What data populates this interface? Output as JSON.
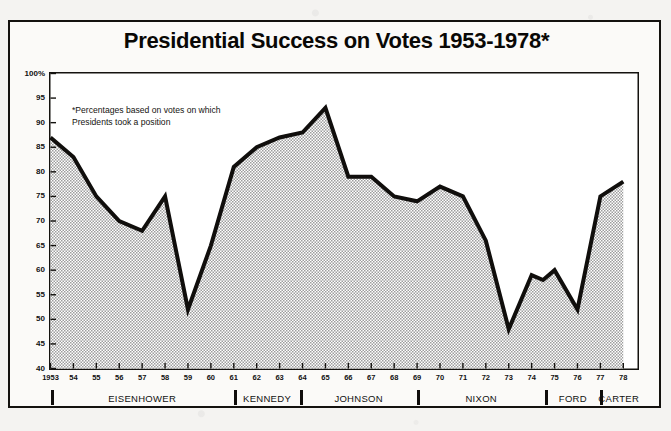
{
  "card": {
    "title": "Presidential Success on Votes 1953-1978*",
    "note": "*Percentages based on votes on which\nPresidents took a position"
  },
  "chart_data": {
    "type": "area",
    "title": "Presidential Success on Votes 1953-1978*",
    "subtitle": "*Percentages based on votes on which Presidents took a position",
    "xlabel": "",
    "ylabel": "",
    "ylim": [
      40,
      100
    ],
    "ytick_step": 5,
    "grid": false,
    "legend": "none",
    "fill": "#b9b9b9",
    "line_color": "#111111",
    "yticks": [
      "40",
      "45",
      "50",
      "55",
      "60",
      "65",
      "70",
      "75",
      "80",
      "85",
      "90",
      "95",
      "100%"
    ],
    "xticks": [
      "1953",
      "54",
      "55",
      "56",
      "57",
      "58",
      "59",
      "60",
      "61",
      "62",
      "63",
      "64",
      "65",
      "66",
      "67",
      "68",
      "69",
      "70",
      "71",
      "72",
      "73",
      "74",
      "75",
      "76",
      "77",
      "78"
    ],
    "x": [
      1953,
      1954,
      1955,
      1956,
      1957,
      1958,
      1959,
      1960,
      1961,
      1962,
      1963,
      1964,
      1965,
      1966,
      1967,
      1968,
      1969,
      1970,
      1971,
      1972,
      1973,
      1974,
      1974.5,
      1975,
      1976,
      1977,
      1978
    ],
    "values": [
      87,
      83,
      75,
      70,
      68,
      75,
      52,
      65,
      81,
      85,
      87,
      88,
      93,
      79,
      79,
      75,
      74,
      77,
      75,
      66,
      48,
      59,
      58,
      60,
      52,
      75,
      78
    ],
    "annotations": [
      {
        "text": "Peak 1965",
        "x": 1965,
        "y": 93
      },
      {
        "text": "Low 1973",
        "x": 1973,
        "y": 48
      }
    ],
    "presidents": [
      {
        "name": "EISENHOWER",
        "start": 1953,
        "end": 1961
      },
      {
        "name": "KENNEDY",
        "start": 1961,
        "end": 1963.9
      },
      {
        "name": "JOHNSON",
        "start": 1963.9,
        "end": 1969
      },
      {
        "name": "NIXON",
        "start": 1969,
        "end": 1974.6
      },
      {
        "name": "FORD",
        "start": 1974.6,
        "end": 1977
      },
      {
        "name": "CARTER",
        "start": 1977,
        "end": 1978.6
      }
    ]
  }
}
